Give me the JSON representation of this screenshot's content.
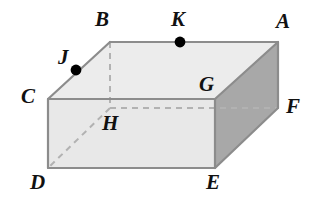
{
  "figure": {
    "name": "rectangular-prism-diagram",
    "canvas": {
      "width": 309,
      "height": 206,
      "background": "#ffffff"
    },
    "colors": {
      "background": "#ffffff",
      "top_face": "#ececec",
      "front_face": "#e8e8e8",
      "right_face": "#a8a8a8",
      "visible_edge": "#8c8c8c",
      "hidden_edge": "#b0b0b0",
      "outline": "#8a8a8a",
      "label_text": "#111111",
      "point_marker": "#000000"
    },
    "vertices": {
      "A": {
        "x": 278,
        "y": 42,
        "hidden": false
      },
      "B": {
        "x": 110,
        "y": 42,
        "hidden": false
      },
      "C": {
        "x": 48,
        "y": 99,
        "hidden": false
      },
      "D": {
        "x": 48,
        "y": 168,
        "hidden": false
      },
      "E": {
        "x": 215,
        "y": 168,
        "hidden": false
      },
      "F": {
        "x": 278,
        "y": 108,
        "hidden": false
      },
      "G": {
        "x": 215,
        "y": 99,
        "hidden": false
      },
      "H": {
        "x": 110,
        "y": 108,
        "hidden": true
      }
    },
    "marked_points": [
      {
        "id": "J",
        "x": 76,
        "y": 70,
        "on_edge": "C-B",
        "radius": 5
      },
      {
        "id": "K",
        "x": 180,
        "y": 42,
        "on_edge": "B-A",
        "radius": 5
      }
    ],
    "faces": [
      {
        "id": "top-face",
        "vertices": "C-B-A-G",
        "fill": "#ececec"
      },
      {
        "id": "front-face",
        "vertices": "C-G-E-D",
        "fill": "#e8e8e8"
      },
      {
        "id": "right-face",
        "vertices": "G-A-F-E",
        "fill": "#a8a8a8"
      }
    ],
    "visible_edges": [
      {
        "id": "edge-C-B",
        "from": "C",
        "to": "B"
      },
      {
        "id": "edge-B-A",
        "from": "B",
        "to": "A"
      },
      {
        "id": "edge-A-F",
        "from": "A",
        "to": "F"
      },
      {
        "id": "edge-C-G",
        "from": "C",
        "to": "G"
      },
      {
        "id": "edge-G-A",
        "from": "G",
        "to": "A"
      },
      {
        "id": "edge-C-D",
        "from": "C",
        "to": "D"
      },
      {
        "id": "edge-D-E",
        "from": "D",
        "to": "E"
      },
      {
        "id": "edge-E-G",
        "from": "E",
        "to": "G"
      },
      {
        "id": "edge-E-F",
        "from": "E",
        "to": "F"
      }
    ],
    "hidden_edges": [
      {
        "id": "edge-B-H",
        "from": "B",
        "to": "H"
      },
      {
        "id": "edge-H-D",
        "from": "H",
        "to": "D"
      },
      {
        "id": "edge-H-F",
        "from": "H",
        "to": "F"
      }
    ],
    "labels": [
      {
        "id": "label-A",
        "text": "A",
        "x": 276,
        "y": 11
      },
      {
        "id": "label-B",
        "text": "B",
        "x": 95,
        "y": 9
      },
      {
        "id": "label-C",
        "text": "C",
        "x": 21,
        "y": 86
      },
      {
        "id": "label-D",
        "text": "D",
        "x": 30,
        "y": 172
      },
      {
        "id": "label-E",
        "text": "E",
        "x": 206,
        "y": 172
      },
      {
        "id": "label-F",
        "text": "F",
        "x": 286,
        "y": 96
      },
      {
        "id": "label-G",
        "text": "G",
        "x": 199,
        "y": 74
      },
      {
        "id": "label-H",
        "text": "H",
        "x": 102,
        "y": 113
      },
      {
        "id": "label-J",
        "text": "J",
        "x": 58,
        "y": 47
      },
      {
        "id": "label-K",
        "text": "K",
        "x": 171,
        "y": 9
      }
    ]
  }
}
